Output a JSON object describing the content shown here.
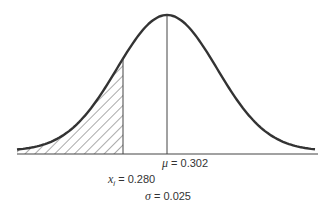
{
  "diagram": {
    "type": "normal-distribution",
    "labels": {
      "mean_symbol": "μ",
      "mean_text": " = 0.302",
      "xi_symbol": "x",
      "xi_sub": "i",
      "xi_text": " = 0.280",
      "sigma_symbol": "σ",
      "sigma_text": " = 0.025"
    },
    "params": {
      "mu": 0.302,
      "sigma": 0.025,
      "x_i": 0.28
    },
    "shaded_region": "left tail below x_i (hatched)",
    "colors": {
      "curve": "#333333",
      "axis": "#444444",
      "hatch": "#555555"
    }
  }
}
